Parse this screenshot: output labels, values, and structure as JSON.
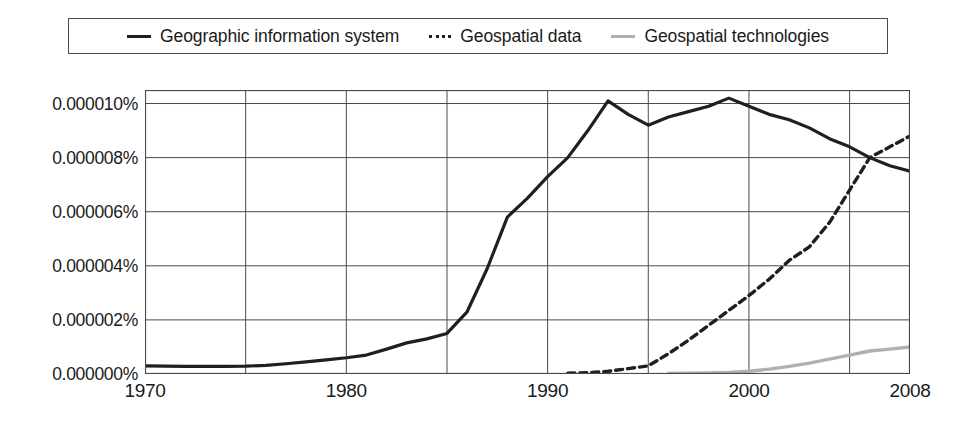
{
  "legend": {
    "items": [
      {
        "label": "Geographic information system",
        "marker": "solid-dark-line-icon",
        "color": "#1f1f1f"
      },
      {
        "label": "Geospatial data",
        "marker": "dashed-line-icon",
        "color": "#1f1f1f"
      },
      {
        "label": "Geospatial technologies",
        "marker": "solid-gray-line-icon",
        "color": "#b0b0b0"
      }
    ]
  },
  "chart_data": {
    "type": "line",
    "title": "",
    "xlabel": "",
    "ylabel": "",
    "xlim": [
      1970,
      2008
    ],
    "ylim": [
      0,
      1.05e-05
    ],
    "grid": true,
    "legend_position": "top",
    "y_tick_labels": [
      "0.000010%",
      "0.000008%",
      "0.000006%",
      "0.000004%",
      "0.000002%",
      "0.000000%"
    ],
    "y_tick_values": [
      1e-05,
      8e-06,
      6e-06,
      4e-06,
      2e-06,
      0.0
    ],
    "x_tick_labels": [
      "1970",
      "1980",
      "1990",
      "2000",
      "2008"
    ],
    "x_tick_values": [
      1970,
      1980,
      1990,
      2000,
      2008
    ],
    "x_gridlines": [
      1975,
      1980,
      1985,
      1990,
      1995,
      2000,
      2005
    ],
    "series": [
      {
        "name": "Geographic information system",
        "style": "solid",
        "color": "#1f1f1f",
        "width": 3.2,
        "x": [
          1970,
          1971,
          1972,
          1973,
          1974,
          1975,
          1976,
          1977,
          1978,
          1979,
          1980,
          1981,
          1982,
          1983,
          1984,
          1985,
          1986,
          1987,
          1988,
          1989,
          1990,
          1991,
          1992,
          1993,
          1994,
          1995,
          1996,
          1997,
          1998,
          1999,
          2000,
          2001,
          2002,
          2003,
          2004,
          2005,
          2006,
          2007,
          2008
        ],
        "values": [
          3e-07,
          2.9e-07,
          2.8e-07,
          2.8e-07,
          2.8e-07,
          2.9e-07,
          3.2e-07,
          3.8e-07,
          4.5e-07,
          5.2e-07,
          6e-07,
          7e-07,
          9.2e-07,
          1.15e-06,
          1.3e-06,
          1.5e-06,
          2.3e-06,
          3.9e-06,
          5.8e-06,
          6.5e-06,
          7.3e-06,
          8e-06,
          9e-06,
          1.01e-05,
          9.6e-06,
          9.2e-06,
          9.5e-06,
          9.7e-06,
          9.9e-06,
          1.02e-05,
          9.9e-06,
          9.6e-06,
          9.4e-06,
          9.1e-06,
          8.7e-06,
          8.4e-06,
          8e-06,
          7.7e-06,
          7.5e-06
        ]
      },
      {
        "name": "Geospatial data",
        "style": "dashed",
        "color": "#1f1f1f",
        "width": 3.4,
        "x": [
          1991,
          1992,
          1993,
          1994,
          1995,
          1996,
          1997,
          1998,
          1999,
          2000,
          2001,
          2002,
          2003,
          2004,
          2005,
          2006,
          2007,
          2008
        ],
        "values": [
          3e-08,
          5e-08,
          1e-07,
          2e-07,
          3e-07,
          7.5e-07,
          1.25e-06,
          1.8e-06,
          2.35e-06,
          2.9e-06,
          3.5e-06,
          4.2e-06,
          4.7e-06,
          5.6e-06,
          6.8e-06,
          8e-06,
          8.4e-06,
          8.8e-06
        ]
      },
      {
        "name": "Geospatial technologies",
        "style": "solid",
        "color": "#b0b0b0",
        "width": 3.4,
        "x": [
          1996,
          1997,
          1998,
          1999,
          2000,
          2001,
          2002,
          2003,
          2004,
          2005,
          2006,
          2007,
          2008
        ],
        "values": [
          2e-08,
          3e-08,
          4e-08,
          6e-08,
          1e-07,
          1.8e-07,
          2.8e-07,
          4e-07,
          5.5e-07,
          7e-07,
          8.5e-07,
          9.2e-07,
          1e-06
        ]
      }
    ]
  }
}
